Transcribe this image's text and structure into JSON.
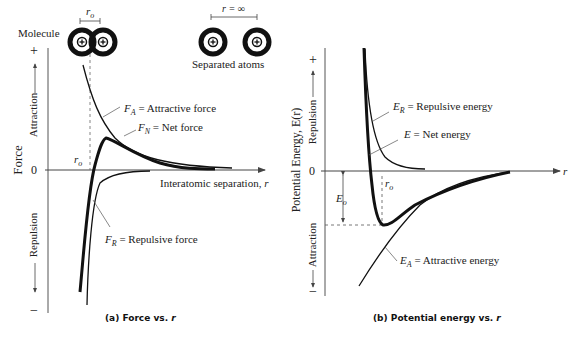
{
  "panel_a": {
    "caption_prefix": "(a) Force vs. ",
    "caption_var": "r",
    "y_axis_title": "Force",
    "y_up_label": "Attraction",
    "y_down_label": "Repulsion",
    "plus": "+",
    "minus": "−",
    "zero": "0",
    "x_axis_label": "Interatomic separation, ",
    "x_axis_var": "r",
    "ro_label": "r",
    "ro_sub": "o",
    "molecule_label": "Molecule",
    "separated_label": "Separated atoms",
    "r_inf_label": "r = ∞",
    "fa_sym": "F",
    "fa_sub": "A",
    "fa_text": " = Attractive force",
    "fn_sym": "F",
    "fn_sub": "N",
    "fn_text": " = Net force",
    "fr_sym": "F",
    "fr_sub": "R",
    "fr_text": " = Repulsive force"
  },
  "panel_b": {
    "caption_prefix": "(b) Potential energy vs. ",
    "caption_var": "r",
    "y_axis_title": "Potential Energy, E(r)",
    "y_up_label": "Repulsion",
    "y_down_label": "Attraction",
    "plus": "+",
    "minus": "−",
    "zero": "0",
    "x_axis_var": "r",
    "ro_label": "r",
    "ro_sub": "o",
    "eo_label": "E",
    "eo_sub": "o",
    "er_sym": "E",
    "er_sub": "R",
    "er_text": " = Repulsive energy",
    "e_sym": "E",
    "e_text": " = Net energy",
    "ea_sym": "E",
    "ea_sub": "A",
    "ea_text": " = Attractive energy"
  },
  "colors": {
    "ink": "#222222",
    "dashed": "#555555"
  }
}
